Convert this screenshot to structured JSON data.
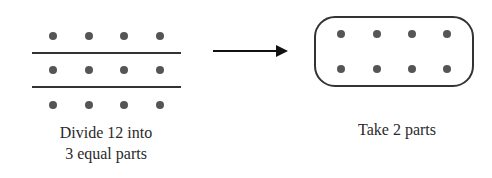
{
  "diagram": {
    "left_panel": {
      "caption_line1": "Divide 12 into",
      "caption_line2": "3 equal parts",
      "rows": 3,
      "dots_per_row": 4,
      "total_dots": 12,
      "dividers": 2
    },
    "arrow": {
      "direction": "right"
    },
    "right_panel": {
      "caption": "Take 2 parts",
      "rows": 2,
      "dots_per_row": 4,
      "total_dots": 8,
      "enclosure": "rounded-rectangle"
    },
    "colors": {
      "dot": "#555555",
      "line": "#333333",
      "text": "#2a2a2a",
      "background": "#ffffff"
    }
  }
}
